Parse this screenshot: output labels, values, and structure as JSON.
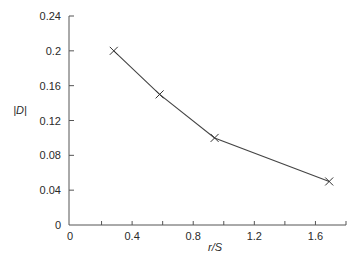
{
  "chart_data": {
    "type": "line",
    "title": "",
    "xlabel": "r/S",
    "ylabel": "|D|",
    "xlim": [
      0,
      1.8
    ],
    "ylim": [
      0,
      0.24
    ],
    "x_ticks": [
      0,
      0.2,
      0.4,
      0.6,
      0.8,
      1.0,
      1.2,
      1.4,
      1.6,
      1.8
    ],
    "x_tick_labels": [
      {
        "value": 0,
        "label": "0"
      },
      {
        "value": 0.4,
        "label": "0.4"
      },
      {
        "value": 0.8,
        "label": "0.8"
      },
      {
        "value": 1.2,
        "label": "1.2"
      },
      {
        "value": 1.6,
        "label": "1.6"
      }
    ],
    "y_ticks": [
      0,
      0.04,
      0.08,
      0.12,
      0.16,
      0.2,
      0.24
    ],
    "y_tick_labels": [
      {
        "value": 0,
        "label": "0"
      },
      {
        "value": 0.04,
        "label": "0.04"
      },
      {
        "value": 0.08,
        "label": "0.08"
      },
      {
        "value": 0.12,
        "label": "0.12"
      },
      {
        "value": 0.16,
        "label": "0.16"
      },
      {
        "value": 0.2,
        "label": "0.2"
      },
      {
        "value": 0.24,
        "label": "0.24"
      }
    ],
    "grid": false,
    "legend": null,
    "series": [
      {
        "name": "|D|",
        "marker": "x",
        "x": [
          0.28,
          0.58,
          0.94,
          1.69
        ],
        "y": [
          0.2,
          0.15,
          0.1,
          0.05
        ]
      }
    ]
  },
  "layout": {
    "plot": {
      "x0": 71,
      "y0": 225,
      "x1": 346,
      "y1": 16
    },
    "colors": {
      "axis": "#555555",
      "line": "#444444",
      "text": "#2a2a2a",
      "background": "#ffffff"
    }
  }
}
